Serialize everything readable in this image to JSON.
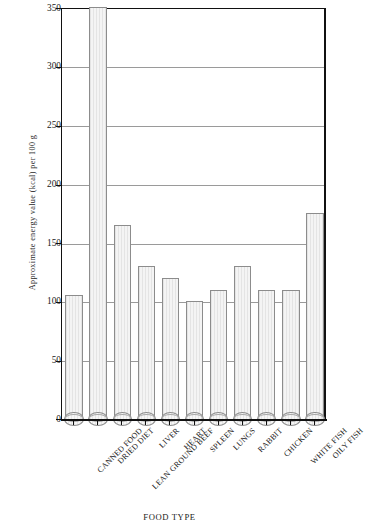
{
  "chart_data": {
    "type": "bar",
    "title": "",
    "xlabel": "FOOD TYPE",
    "ylabel": "Approximate energy value (kcal) per 100 g",
    "ylim": [
      0,
      350
    ],
    "yticks": [
      0,
      50,
      100,
      150,
      200,
      250,
      300,
      350
    ],
    "grid": true,
    "legend": null,
    "categories": [
      "CANNED FOOD",
      "DRIED DIET",
      "LEAN GROUND BEEF",
      "LIVER",
      "HEART",
      "SPLEEN",
      "LUNGS",
      "RABBIT",
      "CHICKEN",
      "WHITE FISH",
      "OILY FISH"
    ],
    "values": [
      105,
      400,
      165,
      130,
      120,
      100,
      110,
      130,
      110,
      110,
      175
    ],
    "value_notes": "DRIED DIET exceeds the plotted axis maximum of 350 and is clipped at the top of the frame",
    "bar_style": "cylinder",
    "bar_fill": "#ececec",
    "bar_edge": "#8c8c8c",
    "grid_color": "#9a9a9a",
    "axis_color": "#111111"
  }
}
